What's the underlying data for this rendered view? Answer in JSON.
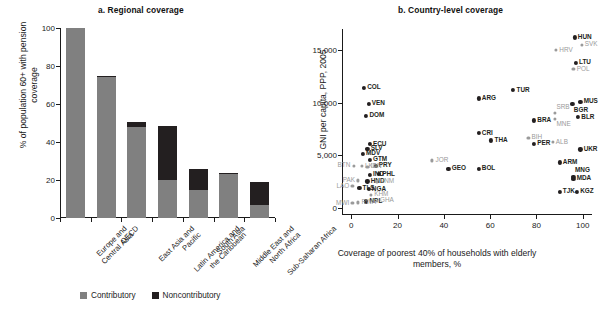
{
  "figure": {
    "panel_a_title": "a.  Regional coverage",
    "panel_b_title": "b.  Country-level coverage"
  },
  "colors": {
    "contributory": "#808080",
    "noncontributory": "#231f20",
    "highlight_label": "#9a9a9a",
    "axis": "#1a1a1a",
    "background": "#ffffff"
  },
  "legend": {
    "contributory_label": "Contributory",
    "noncontributory_label": "Noncontributory"
  },
  "chart_data": [
    {
      "type": "bar",
      "title": "a.  Regional coverage",
      "xlabel": "",
      "ylabel": "% of population 60+ with pension coverage",
      "ylim": [
        0,
        100
      ],
      "yticks": [
        0,
        20,
        40,
        60,
        80,
        100
      ],
      "ytick_labels": [
        "0",
        "20",
        "40",
        "60",
        "80",
        "100"
      ],
      "grid": false,
      "stacked": true,
      "legend_position": "bottom",
      "categories": [
        "Europe and Central Asia",
        "OECD",
        "East Asia and Pacific",
        "Latin America and the Caribbean",
        "South Asia",
        "Middle East and North Africa",
        "Sub-Saharan Africa"
      ],
      "series": [
        {
          "name": "Contributory",
          "color": "#808080",
          "values": [
            100,
            74,
            48,
            20,
            15,
            23,
            7
          ]
        },
        {
          "name": "Noncontributory",
          "color": "#231f20",
          "values": [
            0,
            1,
            2.5,
            28.5,
            11,
            0.5,
            12
          ]
        }
      ],
      "totals": [
        100,
        75,
        50.5,
        48.5,
        26,
        23.5,
        19
      ]
    },
    {
      "type": "scatter",
      "title": "b.  Country-level coverage",
      "xlabel": "Coverage of poorest 40% of households with elderly members, %",
      "ylabel": "GNI per capita, PPP, 2005",
      "xlim": [
        -4,
        104
      ],
      "ylim": [
        -700,
        17000
      ],
      "xticks": [
        0,
        20,
        40,
        60,
        80,
        100
      ],
      "xtick_labels": [
        "0",
        "20",
        "40",
        "60",
        "80",
        "100"
      ],
      "yticks": [
        0,
        5000,
        10000,
        15000
      ],
      "ytick_labels": [
        "0",
        "5,000",
        "10,000",
        "15,000"
      ],
      "grid": false,
      "points": [
        {
          "label": "HUN",
          "x": 96.5,
          "y": 16200,
          "style": "dark",
          "lp": "right"
        },
        {
          "label": "SVK",
          "x": 99.5,
          "y": 15500,
          "style": "light",
          "lp": "right"
        },
        {
          "label": "HRV",
          "x": 88.5,
          "y": 15000,
          "style": "light",
          "lp": "right"
        },
        {
          "label": "LTU",
          "x": 97.0,
          "y": 13800,
          "style": "dark",
          "lp": "right"
        },
        {
          "label": "POL",
          "x": 96.0,
          "y": 13200,
          "style": "light",
          "lp": "right"
        },
        {
          "label": "COL",
          "x": 5.5,
          "y": 11400,
          "style": "dark",
          "lp": "right"
        },
        {
          "label": "TUR",
          "x": 70.0,
          "y": 11200,
          "style": "dark",
          "lp": "right"
        },
        {
          "label": "ARG",
          "x": 55.0,
          "y": 10400,
          "style": "dark",
          "lp": "right"
        },
        {
          "label": "MUS",
          "x": 99.0,
          "y": 10100,
          "style": "dark",
          "lp": "right"
        },
        {
          "label": "BGR",
          "x": 95.5,
          "y": 9850,
          "style": "dark",
          "lp": "below"
        },
        {
          "label": "VEN",
          "x": 7.5,
          "y": 9900,
          "style": "dark",
          "lp": "right"
        },
        {
          "label": "DOM",
          "x": 6.5,
          "y": 8750,
          "style": "dark",
          "lp": "right"
        },
        {
          "label": "BLR",
          "x": 98.0,
          "y": 8600,
          "style": "dark",
          "lp": "right"
        },
        {
          "label": "SRB",
          "x": 88.0,
          "y": 9000,
          "style": "light",
          "lp": "above"
        },
        {
          "label": "BRA",
          "x": 79.0,
          "y": 8300,
          "style": "dark",
          "lp": "right"
        },
        {
          "label": "MNE",
          "x": 88.0,
          "y": 8450,
          "style": "light",
          "lp": "below"
        },
        {
          "label": "CRI",
          "x": 55.0,
          "y": 7100,
          "style": "dark",
          "lp": "right"
        },
        {
          "label": "THA",
          "x": 60.5,
          "y": 6400,
          "style": "dark",
          "lp": "right"
        },
        {
          "label": "BIH",
          "x": 76.5,
          "y": 6650,
          "style": "light",
          "lp": "right"
        },
        {
          "label": "PER",
          "x": 79.0,
          "y": 6100,
          "style": "dark",
          "lp": "right"
        },
        {
          "label": "ALB",
          "x": 87.0,
          "y": 6250,
          "style": "light",
          "lp": "right"
        },
        {
          "label": "UKR",
          "x": 99.0,
          "y": 5550,
          "style": "dark",
          "lp": "right"
        },
        {
          "label": "ECU",
          "x": 8.0,
          "y": 6050,
          "style": "dark",
          "lp": "right"
        },
        {
          "label": "SLV",
          "x": 7.0,
          "y": 5600,
          "style": "dark",
          "lp": "right"
        },
        {
          "label": "MDV",
          "x": 5.0,
          "y": 5150,
          "style": "dark",
          "lp": "right"
        },
        {
          "label": "GTM",
          "x": 8.0,
          "y": 4550,
          "style": "dark",
          "lp": "right"
        },
        {
          "label": "JOR",
          "x": 35.0,
          "y": 4500,
          "style": "light",
          "lp": "right"
        },
        {
          "label": "ARM",
          "x": 90.0,
          "y": 4300,
          "style": "dark",
          "lp": "right"
        },
        {
          "label": "PRY",
          "x": 10.5,
          "y": 4000,
          "style": "dark",
          "lp": "right"
        },
        {
          "label": "BTN",
          "x": 1.0,
          "y": 4000,
          "style": "light",
          "lp": "left"
        },
        {
          "label": "LKA",
          "x": 4.5,
          "y": 3950,
          "style": "light",
          "lp": "right"
        },
        {
          "label": "IDN",
          "x": 7.0,
          "y": 3900,
          "style": "light",
          "lp": "right"
        },
        {
          "label": "GEO",
          "x": 42.0,
          "y": 3700,
          "style": "dark",
          "lp": "right"
        },
        {
          "label": "BOL",
          "x": 55.0,
          "y": 3700,
          "style": "dark",
          "lp": "right"
        },
        {
          "label": "PHL",
          "x": 12.0,
          "y": 3200,
          "style": "dark",
          "lp": "right"
        },
        {
          "label": "IND",
          "x": 8.0,
          "y": 3150,
          "style": "dark",
          "lp": "right"
        },
        {
          "label": "MNG",
          "x": 96.0,
          "y": 2950,
          "style": "dark",
          "lp": "above"
        },
        {
          "label": "MDA",
          "x": 96.0,
          "y": 2750,
          "style": "dark",
          "lp": "right"
        },
        {
          "label": "PAK",
          "x": 3.0,
          "y": 2600,
          "style": "light",
          "lp": "left"
        },
        {
          "label": "HND",
          "x": 7.0,
          "y": 2500,
          "style": "dark",
          "lp": "right"
        },
        {
          "label": "VNM",
          "x": 11.0,
          "y": 2500,
          "style": "light",
          "lp": "right"
        },
        {
          "label": "LAO",
          "x": 0.5,
          "y": 2050,
          "style": "light",
          "lp": "left"
        },
        {
          "label": "TJK",
          "x": 90.0,
          "y": 1500,
          "style": "dark",
          "lp": "right"
        },
        {
          "label": "KGZ",
          "x": 97.5,
          "y": 1500,
          "style": "dark",
          "lp": "right"
        },
        {
          "label": "TLS",
          "x": 3.5,
          "y": 1850,
          "style": "dark",
          "lp": "right"
        },
        {
          "label": "NGA",
          "x": 7.5,
          "y": 1750,
          "style": "dark",
          "lp": "right"
        },
        {
          "label": "KHM",
          "x": 8.5,
          "y": 1250,
          "style": "light",
          "lp": "right"
        },
        {
          "label": "NPL",
          "x": 6.5,
          "y": 600,
          "style": "dark",
          "lp": "right"
        },
        {
          "label": "GHA",
          "x": 11.0,
          "y": 650,
          "style": "light",
          "lp": "right"
        },
        {
          "label": "MWI",
          "x": 0.5,
          "y": 450,
          "style": "light",
          "lp": "left"
        },
        {
          "label": "RWA",
          "x": 3.0,
          "y": 500,
          "style": "light",
          "lp": "right"
        }
      ]
    }
  ]
}
